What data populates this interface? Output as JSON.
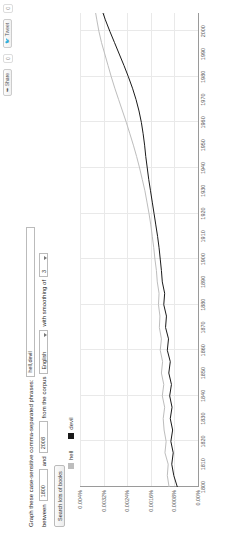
{
  "topbar": {
    "share_label": "Share",
    "share_count": "0",
    "tweet_label": "Tweet",
    "tweet_count": "0"
  },
  "form": {
    "graph_label": "Graph these case-sensitive comma-separated phrases:",
    "phrases_value": "hell,devil",
    "between_label": "between",
    "year_start": "1800",
    "and_label": "and",
    "year_end": "2008",
    "corpus_label": "from the corpus",
    "corpus_value": "English",
    "smoothing_label": "with smoothing of",
    "smoothing_value": "3",
    "search_button": "Search lots of books"
  },
  "legend": [
    {
      "label": "hell",
      "color": "#bdbdbd"
    },
    {
      "label": "devil",
      "color": "#1a1a1a"
    }
  ],
  "chart_data": {
    "type": "line",
    "title": "",
    "xlabel": "",
    "ylabel": "",
    "xlim": [
      1800,
      2008
    ],
    "ylim": [
      0,
      0.004
    ],
    "grid": true,
    "legend_position": "top-left",
    "ytick_labels": [
      "0.00%",
      "0.0008%",
      "0.0016%",
      "0.0024%",
      "0.0032%",
      "0.004%"
    ],
    "ytick_values": [
      0,
      0.0008,
      0.0016,
      0.0024,
      0.0032,
      0.004
    ],
    "xtick_labels": [
      "1800",
      "1810",
      "1820",
      "1830",
      "1840",
      "1850",
      "1860",
      "1870",
      "1880",
      "1890",
      "1900",
      "1910",
      "1920",
      "1930",
      "1940",
      "1950",
      "1960",
      "1970",
      "1980",
      "1990",
      "2000"
    ],
    "xtick_values": [
      1800,
      1810,
      1820,
      1830,
      1840,
      1850,
      1860,
      1870,
      1880,
      1890,
      1900,
      1910,
      1920,
      1930,
      1940,
      1950,
      1960,
      1970,
      1980,
      1990,
      2000
    ],
    "series": [
      {
        "name": "hell",
        "color": "#bdbdbd",
        "x": [
          1800,
          1805,
          1810,
          1815,
          1820,
          1825,
          1830,
          1835,
          1840,
          1845,
          1850,
          1855,
          1860,
          1865,
          1870,
          1875,
          1880,
          1885,
          1890,
          1895,
          1900,
          1905,
          1910,
          1915,
          1920,
          1925,
          1930,
          1935,
          1940,
          1945,
          1950,
          1955,
          1960,
          1965,
          1970,
          1975,
          1980,
          1985,
          1990,
          1995,
          2000,
          2005,
          2008
        ],
        "values": [
          0.00098,
          0.00104,
          0.00101,
          0.00112,
          0.00108,
          0.00115,
          0.00118,
          0.00113,
          0.00121,
          0.00116,
          0.00124,
          0.0012,
          0.00128,
          0.00124,
          0.00131,
          0.00129,
          0.00134,
          0.00132,
          0.00138,
          0.00141,
          0.00146,
          0.0015,
          0.00155,
          0.0016,
          0.00166,
          0.00173,
          0.0018,
          0.00189,
          0.00198,
          0.00208,
          0.00219,
          0.00231,
          0.00243,
          0.00256,
          0.00269,
          0.00282,
          0.00294,
          0.00305,
          0.00316,
          0.00327,
          0.00336,
          0.00343,
          0.00347
        ]
      },
      {
        "name": "devil",
        "color": "#1a1a1a",
        "x": [
          1800,
          1805,
          1810,
          1815,
          1820,
          1825,
          1830,
          1835,
          1840,
          1845,
          1850,
          1855,
          1860,
          1865,
          1870,
          1875,
          1880,
          1885,
          1890,
          1895,
          1900,
          1905,
          1910,
          1915,
          1920,
          1925,
          1930,
          1935,
          1940,
          1945,
          1950,
          1955,
          1960,
          1965,
          1970,
          1975,
          1980,
          1985,
          1990,
          1995,
          2000,
          2005,
          2008
        ],
        "values": [
          0.0007,
          0.00082,
          0.00089,
          0.00084,
          0.00092,
          0.00086,
          0.00094,
          0.00088,
          0.00096,
          0.0009,
          0.00099,
          0.00094,
          0.00104,
          0.001,
          0.0011,
          0.00107,
          0.00116,
          0.00113,
          0.00121,
          0.00124,
          0.00128,
          0.00132,
          0.00137,
          0.00143,
          0.00149,
          0.00155,
          0.00161,
          0.00167,
          0.00172,
          0.00177,
          0.00181,
          0.00186,
          0.00192,
          0.002,
          0.0021,
          0.00222,
          0.00236,
          0.00251,
          0.00267,
          0.00283,
          0.00299,
          0.00314,
          0.00322
        ]
      }
    ]
  }
}
